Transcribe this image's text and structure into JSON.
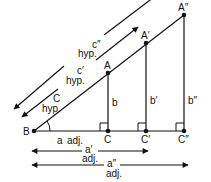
{
  "diagram": {
    "colors": {
      "stroke": "#111111",
      "background": "#ffffff"
    },
    "points": {
      "B": "B",
      "A": "A",
      "A1": "A′",
      "A2": "A″",
      "C": "C",
      "C1": "C′",
      "C2": "C″"
    },
    "legs": {
      "b": "b",
      "b1": "b′",
      "b2": "b″"
    },
    "hypotenuses": {
      "c": "C",
      "c_hyp": "hyp.",
      "c1": "c′",
      "c1_hyp": "hyp.",
      "c2": "c″",
      "c2_hyp": "hyp."
    },
    "adjacent": {
      "a": "a",
      "a_adj": "adj.",
      "a1": "a′",
      "a1_adj": "adj.",
      "a2": "a″",
      "a2_adj": "adj."
    }
  }
}
